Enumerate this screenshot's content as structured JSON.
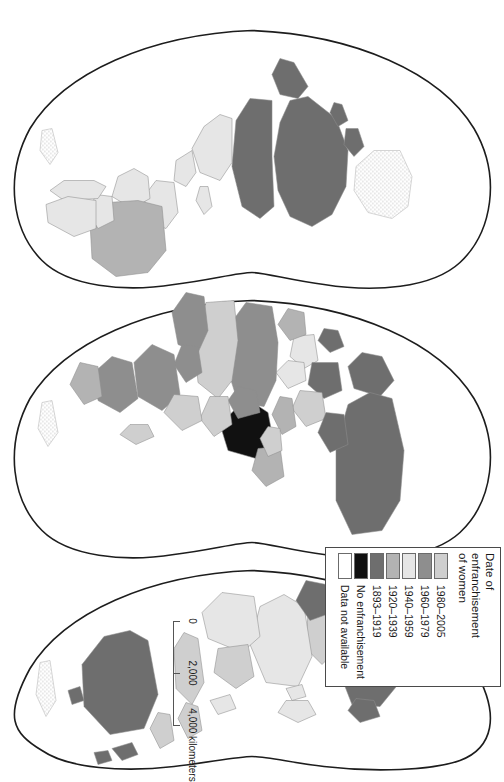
{
  "figure": {
    "kind": "world-choropleth-map",
    "projection": "interrupted-homolosine",
    "orientation": "rotated-90-clockwise"
  },
  "legend": {
    "title": "Date of\nenfranchisement\nof women",
    "title_lines": [
      "Date of",
      "enfranchisement",
      "of women"
    ],
    "items": [
      {
        "label": "1980–2005",
        "color": "#cfcfcf"
      },
      {
        "label": "1960–1979",
        "color": "#8e8e8e"
      },
      {
        "label": "1940–1959",
        "color": "#e6e6e6"
      },
      {
        "label": "1920–1939",
        "color": "#b3b3b3"
      },
      {
        "label": "1893–1919",
        "color": "#6e6e6e"
      },
      {
        "label": "No enfranchisement",
        "color": "#111111"
      },
      {
        "label": "Data not available",
        "color": "#ffffff",
        "pattern": "stipple"
      }
    ]
  },
  "scale_bar": {
    "unit": "kilometers",
    "ticks": [
      {
        "value": "0",
        "pos": 0
      },
      {
        "value": "2,000",
        "pos": 50
      },
      {
        "value": "4,000",
        "pos": 100
      }
    ],
    "max_label": "4,000 kilometers"
  },
  "chart_data": {
    "type": "map",
    "title": "Date of enfranchisement of women",
    "legend_position": "bottom-right",
    "categories": [
      "1980–2005",
      "1960–1979",
      "1940–1959",
      "1920–1939",
      "1893–1919",
      "No enfranchisement",
      "Data not available"
    ],
    "colors": [
      "#cfcfcf",
      "#8e8e8e",
      "#e6e6e6",
      "#b3b3b3",
      "#6e6e6e",
      "#111111",
      "#ffffff"
    ],
    "regions": [
      {
        "name": "Canada",
        "category": "1893–1919"
      },
      {
        "name": "United States",
        "category": "1893–1919"
      },
      {
        "name": "Greenland",
        "category": "Data not available"
      },
      {
        "name": "Mexico",
        "category": "1940–1959"
      },
      {
        "name": "Central America",
        "category": "1940–1959"
      },
      {
        "name": "Brazil",
        "category": "1920–1939"
      },
      {
        "name": "Argentina",
        "category": "1940–1959"
      },
      {
        "name": "Chile",
        "category": "1940–1959"
      },
      {
        "name": "Peru",
        "category": "1940–1959"
      },
      {
        "name": "Colombia",
        "category": "1940–1959"
      },
      {
        "name": "Scandinavia",
        "category": "1893–1919"
      },
      {
        "name": "United Kingdom",
        "category": "1893–1919"
      },
      {
        "name": "Russia",
        "category": "1893–1919"
      },
      {
        "name": "Germany",
        "category": "1893–1919"
      },
      {
        "name": "France",
        "category": "1940–1959"
      },
      {
        "name": "Spain",
        "category": "1920–1939"
      },
      {
        "name": "Italy",
        "category": "1940–1959"
      },
      {
        "name": "Saudi Arabia",
        "category": "No enfranchisement"
      },
      {
        "name": "India",
        "category": "1940–1959"
      },
      {
        "name": "China",
        "category": "1940–1959"
      },
      {
        "name": "Japan",
        "category": "1940–1959"
      },
      {
        "name": "North Africa",
        "category": "1960–1979"
      },
      {
        "name": "Sub-Saharan Africa",
        "category": "1960–1979"
      },
      {
        "name": "South Africa",
        "category": "1920–1939"
      },
      {
        "name": "Australia",
        "category": "1893–1919"
      },
      {
        "name": "New Zealand",
        "category": "1893–1919"
      },
      {
        "name": "Antarctica",
        "category": "Data not available"
      }
    ]
  }
}
